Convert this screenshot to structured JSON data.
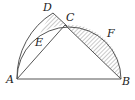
{
  "diagram": {
    "type": "geometry",
    "points": {
      "A": {
        "label": "A",
        "x": 17,
        "y": 79
      },
      "B": {
        "label": "B",
        "x": 121,
        "y": 79
      },
      "C": {
        "label": "C",
        "x": 65,
        "y": 25
      },
      "D": {
        "label": "D",
        "x": 53,
        "y": 13
      },
      "E": {
        "label": "E"
      },
      "F": {
        "label": "F"
      }
    },
    "segments": [
      "AB",
      "AC",
      "CB",
      "DC"
    ],
    "arcs": [
      "semicircle on AB through C and F",
      "arc A to D through E"
    ],
    "shaded_regions": [
      "segment between chord CB and arc CFB",
      "region near D between arc AD, DC and arc AC"
    ],
    "colors": {
      "stroke": "#555555",
      "hatch": "#777777",
      "background": "#ffffff"
    }
  }
}
